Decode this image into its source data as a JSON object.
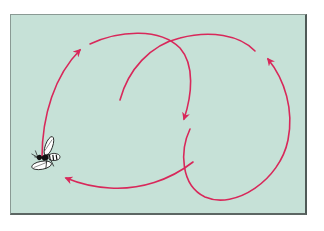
{
  "figure": {
    "background_color": "#c6e1d7",
    "path_color": "#d8285a",
    "border_color": "#4f5a57"
  },
  "elements": {
    "bee": {
      "label": "bee",
      "position": [
        45,
        158
      ]
    },
    "paths": [
      {
        "name": "left-ascending-arc",
        "arrow": "up-right"
      },
      {
        "name": "top-arc-descending",
        "arrow": "down"
      },
      {
        "name": "inner-rising-arc",
        "arrow": "none"
      },
      {
        "name": "right-loop",
        "arrow": "up"
      },
      {
        "name": "bottom-return-arc",
        "arrow": "left"
      }
    ]
  }
}
